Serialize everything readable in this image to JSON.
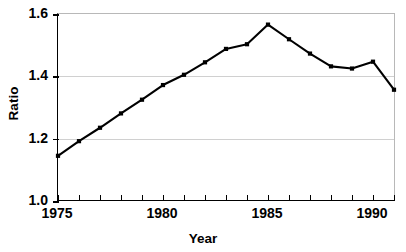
{
  "chart_data": {
    "type": "line",
    "title": "",
    "xlabel": "Year",
    "ylabel": "Ratio",
    "xlim": [
      1975,
      1991
    ],
    "ylim": [
      1.0,
      1.6
    ],
    "grid": true,
    "legend": "none",
    "marker": "filled-square",
    "line_color": "#000000",
    "x": [
      1975,
      1976,
      1977,
      1978,
      1979,
      1980,
      1981,
      1982,
      1983,
      1984,
      1985,
      1986,
      1987,
      1988,
      1989,
      1990,
      1991
    ],
    "values": [
      1.145,
      1.192,
      1.235,
      1.281,
      1.325,
      1.372,
      1.405,
      1.445,
      1.488,
      1.503,
      1.566,
      1.519,
      1.473,
      1.432,
      1.425,
      1.447,
      1.357
    ],
    "x_ticks_major": [
      1975,
      1980,
      1985,
      1990
    ],
    "x_ticks_minor": [
      1976,
      1977,
      1978,
      1979,
      1981,
      1982,
      1983,
      1984,
      1986,
      1987,
      1988,
      1989,
      1991
    ],
    "y_ticks": [
      1.0,
      1.2,
      1.4,
      1.6
    ],
    "y_tick_labels": [
      "1.0",
      "1.2",
      "1.4",
      "1.6"
    ],
    "x_tick_labels": [
      "1975",
      "1980",
      "1985",
      "1990"
    ]
  }
}
